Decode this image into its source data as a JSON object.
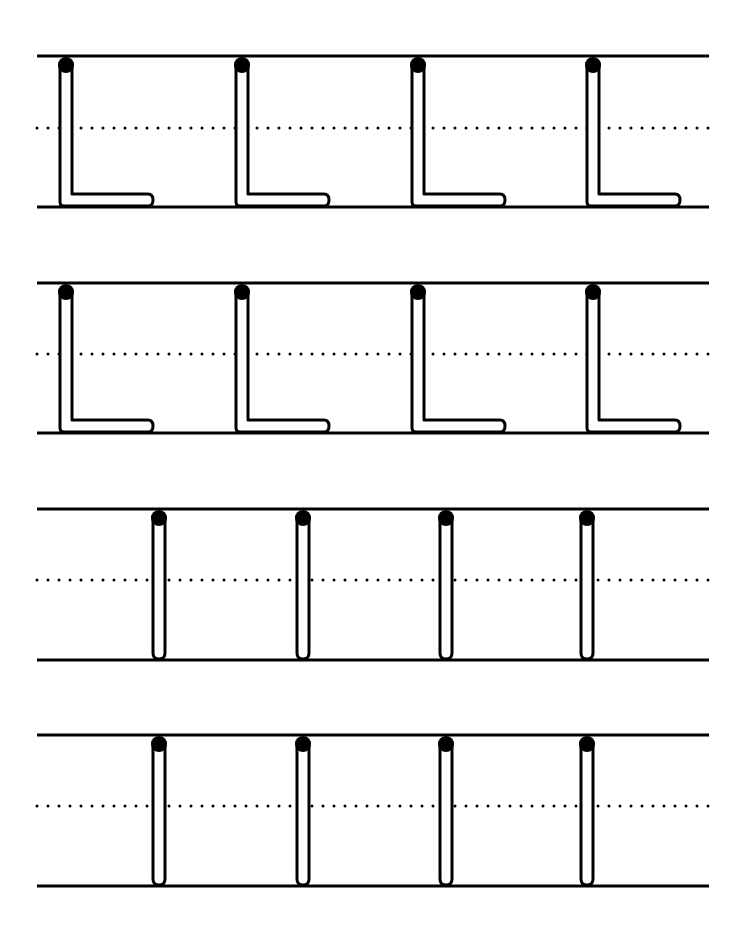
{
  "worksheet": {
    "type": "handwriting-practice",
    "line_left_x": 37,
    "line_right_x": 709,
    "stroke_color": "#000000",
    "background": "#ffffff",
    "rows": [
      {
        "letter": "L",
        "case": "uppercase",
        "top_y": 56,
        "mid_y": 128,
        "base_y": 207,
        "glyph_x": [
          66,
          242,
          418,
          593
        ]
      },
      {
        "letter": "L",
        "case": "uppercase",
        "top_y": 283,
        "mid_y": 354,
        "base_y": 433,
        "glyph_x": [
          66,
          242,
          418,
          593
        ]
      },
      {
        "letter": "l",
        "case": "lowercase",
        "top_y": 509,
        "mid_y": 580,
        "base_y": 660,
        "glyph_x": [
          159,
          303,
          446,
          587
        ]
      },
      {
        "letter": "l",
        "case": "lowercase",
        "top_y": 735,
        "mid_y": 806,
        "base_y": 886,
        "glyph_x": [
          159,
          303,
          446,
          587
        ]
      }
    ]
  }
}
